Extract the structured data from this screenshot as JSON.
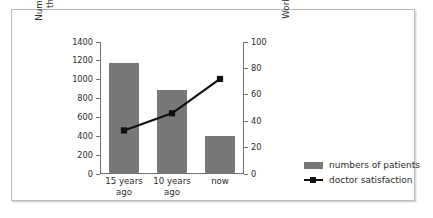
{
  "chart_data": {
    "type": "bar",
    "title": "",
    "subtitle": "",
    "categories": [
      "15 years\nago",
      "10 years\nago",
      "now"
    ],
    "series": [
      {
        "name": "numbers of patients",
        "type": "bar",
        "axis": "left",
        "values": [
          1180,
          890,
          400
        ],
        "color": "#787878"
      },
      {
        "name": "doctor satisfaction",
        "type": "line",
        "axis": "right",
        "values": [
          33,
          46,
          72
        ],
        "color": "#111111",
        "marker": "square"
      }
    ],
    "xlabel": "",
    "ylabel": "Number of patients who visit\nthe hospital in one day",
    "y2label": "Working environment for doctors",
    "ylim": [
      0,
      1400
    ],
    "y2lim": [
      0,
      100
    ],
    "yticks": [
      0,
      200,
      400,
      600,
      800,
      1000,
      1200,
      1400
    ],
    "y2ticks": [
      0,
      20,
      40,
      60,
      80,
      100
    ],
    "grid": false,
    "legend_position": "right"
  },
  "axes": {
    "left": {
      "label": "Number of patients who visit\nthe hospital in one day",
      "ticks": [
        "0",
        "200",
        "400",
        "600",
        "800",
        "1000",
        "1200",
        "1400"
      ]
    },
    "right": {
      "label": "Working environment for doctors",
      "ticks": [
        "0",
        "20",
        "40",
        "60",
        "80",
        "100"
      ]
    },
    "category_labels": [
      "15 years\nago",
      "10 years\nago",
      "now"
    ]
  },
  "legend": {
    "items": [
      {
        "label": "numbers of patients",
        "color": "#787878",
        "kind": "bar"
      },
      {
        "label": "doctor satisfaction",
        "color": "#111111",
        "kind": "line-marker"
      }
    ]
  },
  "colors": {
    "bar": "#787878",
    "line": "#111111",
    "axis": "#6f6f6f",
    "frame": "#b9b9b9",
    "background": "#ffffff",
    "text": "#2b2b2b"
  }
}
